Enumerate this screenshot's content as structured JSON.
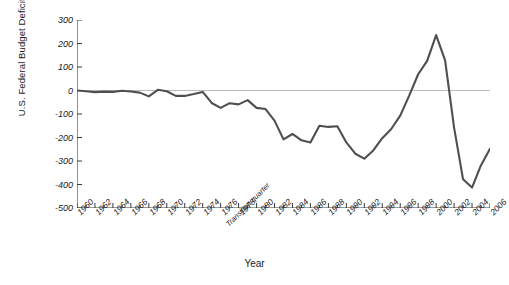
{
  "chart_data": {
    "type": "line",
    "title": "",
    "xlabel": "Year",
    "ylabel": "U.S. Federal Budget Deficits (billion dollars)",
    "xlim": [
      1960,
      2006
    ],
    "ylim": [
      -500,
      300
    ],
    "yticks": [
      300,
      200,
      100,
      0,
      -100,
      -200,
      -300,
      -400,
      -500
    ],
    "ytick_labels": [
      "300",
      "200",
      "100",
      "0",
      "-100",
      "-200",
      "-300",
      "-400",
      "-500"
    ],
    "xticks": [
      1960,
      1962,
      1964,
      1966,
      1968,
      1970,
      1972,
      1974,
      1976,
      1978,
      1980,
      1982,
      1984,
      1986,
      1988,
      1990,
      1992,
      1994,
      1996,
      1998,
      2000,
      2002,
      2004,
      2006
    ],
    "xtick_labels": [
      "1960",
      "1962",
      "1964",
      "1966",
      "1968",
      "1970",
      "1972",
      "1974",
      "1976",
      "1978",
      "1980",
      "1982",
      "1984",
      "1986",
      "1988",
      "1990",
      "1992",
      "1994",
      "1996",
      "1998",
      "2000",
      "2002",
      "2004",
      "2006"
    ],
    "annotations": [
      {
        "text": "Transition quarter",
        "x": 1976.6,
        "kind": "x-axis-extra-label"
      }
    ],
    "grid": false,
    "zero_line": true,
    "legend": null,
    "minor_ticks_per_interval": 2,
    "series": [
      {
        "name": "U.S. Federal Budget Deficit/Surplus",
        "color": "#4f4f4f",
        "x": [
          1960,
          1961,
          1962,
          1963,
          1964,
          1965,
          1966,
          1967,
          1968,
          1969,
          1970,
          1971,
          1972,
          1973,
          1974,
          1975,
          1976,
          1977,
          1978,
          1979,
          1980,
          1981,
          1982,
          1983,
          1984,
          1985,
          1986,
          1987,
          1988,
          1989,
          1990,
          1991,
          1992,
          1993,
          1994,
          1995,
          1996,
          1997,
          1998,
          1999,
          2000,
          2001,
          2002,
          2003,
          2004,
          2005,
          2006
        ],
        "values": [
          0,
          -3,
          -7,
          -5,
          -6,
          -1,
          -4,
          -9,
          -25,
          3,
          -3,
          -23,
          -23,
          -15,
          -6,
          -53,
          -74,
          -54,
          -59,
          -41,
          -74,
          -79,
          -128,
          -208,
          -185,
          -212,
          -221,
          -150,
          -155,
          -152,
          -221,
          -269,
          -290,
          -255,
          -203,
          -164,
          -107,
          -22,
          69,
          126,
          236,
          128,
          -158,
          -378,
          -413,
          -318,
          -248
        ]
      }
    ]
  }
}
